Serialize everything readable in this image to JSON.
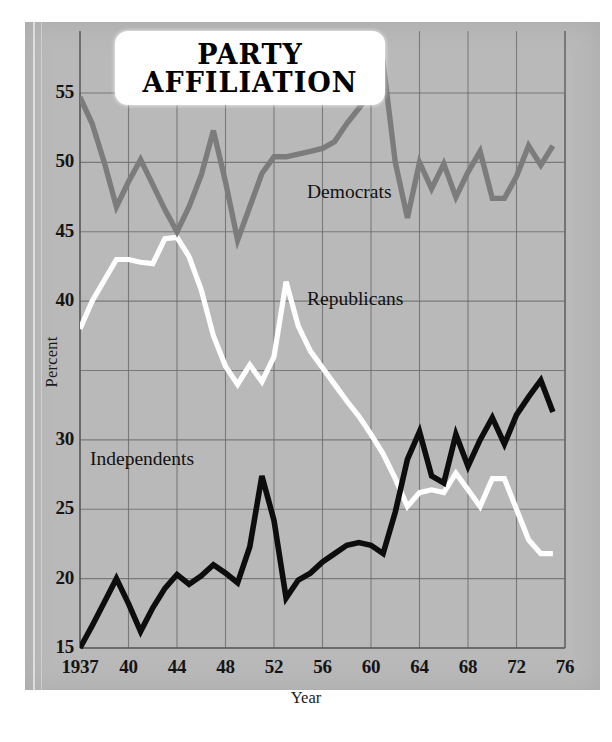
{
  "title": {
    "line1": "PARTY",
    "line2": "AFFILIATION"
  },
  "axes": {
    "xlabel": "Year",
    "ylabel": "Percent",
    "ytick_labels": [
      "55",
      "50",
      "45",
      "40",
      "30",
      "25",
      "20",
      "15"
    ],
    "xtick_labels": [
      "1937",
      "40",
      "44",
      "48",
      "52",
      "56",
      "60",
      "64",
      "68",
      "72",
      "76"
    ]
  },
  "annotations": {
    "democrats": "Democrats",
    "republicans": "Republicans",
    "independents": "Independents"
  },
  "colors": {
    "panel": "#b9b9b9",
    "grid": "#6f6f6f",
    "democrats": "#7c7c7c",
    "republicans": "#ffffff",
    "independents": "#0d0d0d",
    "text": "#141414"
  },
  "chart_data": {
    "type": "line",
    "title": "PARTY AFFILIATION",
    "xlabel": "Year",
    "ylabel": "Percent",
    "xlim": [
      1937,
      1977
    ],
    "ylim": [
      15,
      55
    ],
    "grid": true,
    "legend": "inline-annotations",
    "x": [
      1937,
      1938,
      1939,
      1940,
      1941,
      1942,
      1943,
      1944,
      1945,
      1946,
      1947,
      1948,
      1949,
      1950,
      1951,
      1952,
      1953,
      1954,
      1955,
      1956,
      1957,
      1958,
      1959,
      1960,
      1961,
      1962,
      1963,
      1964,
      1965,
      1966,
      1967,
      1968,
      1969,
      1970,
      1971,
      1972,
      1973,
      1974,
      1975,
      1976
    ],
    "series": [
      {
        "name": "Democrats",
        "color": "#7c7c7c",
        "values": [
          54.7,
          52.8,
          50.0,
          46.8,
          48.6,
          50.2,
          48.4,
          46.6,
          45.0,
          46.8,
          49.1,
          52.3,
          48.6,
          44.4,
          46.8,
          49.2,
          50.4,
          50.4,
          50.6,
          50.8,
          51.0,
          51.5,
          52.8,
          53.9,
          55.1,
          57.2,
          50.0,
          46.0,
          50.0,
          48.1,
          49.9,
          47.5,
          49.3,
          50.8,
          47.4,
          47.4,
          49.0,
          51.2,
          49.8,
          51.2
        ]
      },
      {
        "name": "Republicans",
        "color": "#ffffff",
        "values": [
          38.0,
          40.0,
          41.5,
          43.0,
          43.0,
          42.8,
          42.7,
          44.5,
          44.6,
          43.2,
          40.8,
          37.5,
          35.3,
          34.0,
          35.4,
          34.2,
          36.0,
          41.4,
          38.2,
          36.4,
          35.2,
          34.0,
          32.8,
          31.7,
          30.4,
          29.0,
          27.2,
          25.2,
          26.2,
          26.4,
          26.2,
          27.6,
          26.4,
          25.2,
          27.2,
          27.2,
          25.0,
          22.8,
          21.8,
          21.8
        ]
      },
      {
        "name": "Independents",
        "color": "#0d0d0d",
        "values": [
          15.0,
          16.6,
          18.3,
          20.0,
          18.2,
          16.2,
          17.9,
          19.3,
          20.3,
          19.6,
          20.2,
          21.0,
          20.4,
          19.7,
          22.3,
          27.4,
          24.2,
          18.6,
          19.9,
          20.4,
          21.2,
          21.8,
          22.4,
          22.6,
          22.4,
          21.8,
          24.8,
          28.6,
          30.6,
          27.4,
          26.9,
          30.4,
          28.1,
          30.0,
          31.6,
          29.7,
          31.8,
          33.1,
          34.3,
          32.0
        ]
      }
    ]
  }
}
